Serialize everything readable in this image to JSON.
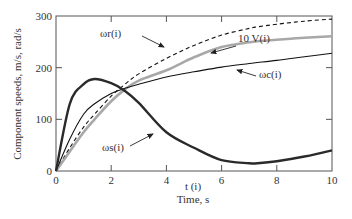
{
  "chart_data": {
    "type": "line",
    "title": "",
    "xlabel": "Time, s",
    "xlabel_var": "t (i)",
    "ylabel": "Component speeds, m/s, rad/s",
    "xlim": [
      0,
      10
    ],
    "ylim": [
      0,
      300
    ],
    "xticks": [
      0,
      2,
      4,
      6,
      8,
      10
    ],
    "yticks": [
      0,
      100,
      200,
      300
    ],
    "grid": false,
    "legend": "inline annotations with arrows",
    "x": [
      0,
      0.5,
      1,
      1.4,
      2,
      2.5,
      3,
      4,
      5,
      6,
      7,
      7.3,
      8,
      9,
      10
    ],
    "series": [
      {
        "name": "ωr(i)",
        "style": "dashed black",
        "values": [
          0,
          45,
          85,
          110,
          145,
          168,
          188,
          218,
          243,
          263,
          276,
          279,
          284,
          290,
          294
        ]
      },
      {
        "name": "10 V(i)",
        "style": "thick grey",
        "values": [
          0,
          38,
          75,
          100,
          135,
          158,
          175,
          195,
          220,
          240,
          249,
          251,
          254,
          258,
          261
        ]
      },
      {
        "name": "ωc(i)",
        "style": "thin black",
        "values": [
          0,
          62,
          110,
          130,
          150,
          160,
          168,
          182,
          192,
          201,
          208,
          210,
          214,
          221,
          228
        ]
      },
      {
        "name": "ωs(i)",
        "style": "thick black",
        "values": [
          0,
          130,
          168,
          178,
          170,
          155,
          132,
          75,
          45,
          21,
          15,
          15,
          19,
          28,
          40
        ]
      }
    ]
  },
  "labels": {
    "wr": "ωr(i)",
    "v": "10 V(i)",
    "wc": "ωc(i)",
    "ws": "ωs(i)",
    "xvar": "t (i)",
    "xtitle": "Time, s",
    "ytitle": "Component speeds, m/s, rad/s"
  }
}
